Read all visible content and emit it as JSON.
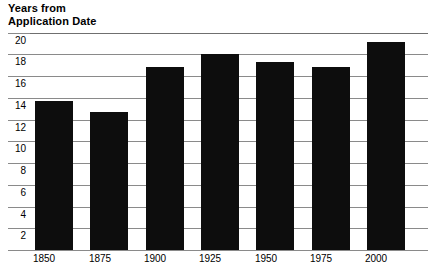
{
  "chart_data": {
    "type": "bar",
    "title": "Years from\nApplication Date",
    "xlabel": "",
    "ylabel": "Years from Application Date",
    "categories": [
      "1850",
      "1875",
      "1900",
      "1925",
      "1950",
      "1975",
      "2000"
    ],
    "values": [
      13.7,
      12.7,
      16.9,
      18.1,
      17.3,
      16.9,
      19.2
    ],
    "ylim": [
      0,
      20
    ],
    "yticks": [
      2,
      4,
      6,
      8,
      10,
      12,
      14,
      16,
      18,
      20
    ],
    "ytick_labels": [
      "2",
      "4",
      "6",
      "8",
      "10",
      "12",
      "14",
      "16",
      "18",
      "20"
    ],
    "grid": true,
    "legend": false,
    "bar_color": "#0d0d0d",
    "grid_color": "#8a8a8a",
    "background_color": "#ffffff"
  },
  "title": {
    "line1": "Years from",
    "line2": "Application Date",
    "full": "Years from\nApplication Date"
  }
}
